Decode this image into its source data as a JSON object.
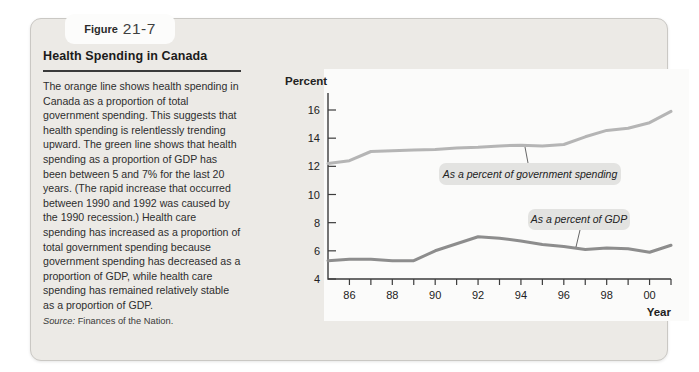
{
  "figure": {
    "label": "Figure",
    "number": "21-7"
  },
  "header": {
    "title": "Health Spending in Canada"
  },
  "description": {
    "body": "The orange line shows health spending in Canada as a proportion of total government spending. This suggests that health spending is relentlessly trending upward. The green line shows that health spending as a proportion of GDP has been between 5 and 7% for the last 20 years. (The rapid increase that occurred between 1990 and 1992 was caused by the 1990 recession.) Health care spending has increased as a proportion of total government spending because government spending has decreased as a proportion of GDP, while health care spending has remained relatively stable as a proportion of GDP."
  },
  "source": {
    "prefix": "Source:",
    "text": "Finances of the Nation."
  },
  "chart_data": {
    "type": "line",
    "title": "",
    "ylabel": "Percent",
    "xlabel": "Year",
    "xlim": [
      1985,
      2001
    ],
    "ylim": [
      4,
      17.2
    ],
    "grid": false,
    "x": [
      1985,
      1986,
      1987,
      1988,
      1989,
      1990,
      1991,
      1992,
      1993,
      1994,
      1995,
      1996,
      1997,
      1998,
      1999,
      2000,
      2001
    ],
    "yticks": [
      4,
      6,
      8,
      10,
      12,
      14,
      16
    ],
    "x_minor_tick_years": [
      1986,
      1987,
      1988,
      1989,
      1990,
      1991,
      1992,
      1993,
      1994,
      1995,
      1996,
      1997,
      1998,
      1999,
      2000,
      2001
    ],
    "x_labeled_ticks": [
      {
        "year": 1986,
        "label": "86"
      },
      {
        "year": 1988,
        "label": "88"
      },
      {
        "year": 1990,
        "label": "90"
      },
      {
        "year": 1992,
        "label": "92"
      },
      {
        "year": 1994,
        "label": "94"
      },
      {
        "year": 1996,
        "label": "96"
      },
      {
        "year": 1998,
        "label": "98"
      },
      {
        "year": 2000,
        "label": "00"
      }
    ],
    "series": [
      {
        "name": "government_spending",
        "label": "As a percent of government spending",
        "color": "#b5b5b5",
        "values": [
          12.2,
          12.4,
          13.05,
          13.1,
          13.15,
          13.2,
          13.3,
          13.35,
          13.45,
          13.5,
          13.45,
          13.55,
          14.1,
          14.55,
          14.7,
          15.1,
          15.9
        ]
      },
      {
        "name": "gdp",
        "label": "As a percent of GDP",
        "color": "#8d8d8d",
        "values": [
          5.3,
          5.4,
          5.4,
          5.3,
          5.3,
          6.0,
          6.5,
          7.0,
          6.9,
          6.7,
          6.45,
          6.3,
          6.1,
          6.2,
          6.15,
          5.9,
          6.4
        ]
      }
    ],
    "annotation_box_color": "#e3e3e1"
  }
}
